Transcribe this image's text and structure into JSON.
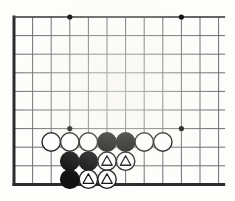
{
  "diagram": {
    "kind": "go-board-corner-diagram",
    "title": "",
    "board": {
      "orientation": "top-left-corner",
      "columns": 10,
      "rows": 10,
      "grid_spacing_px": 18.6,
      "origin_x_px": 14,
      "origin_y_px": 17,
      "line_color": "#6d6f70",
      "border_color": "#2c2c2c",
      "border_width_px": 3,
      "line_width_px": 1,
      "background_color": "#fdfdfb",
      "edges": {
        "left": "board-edge",
        "top": "board-edge",
        "bottom": "board-edge",
        "right": "cropped"
      }
    },
    "star_points": {
      "color": "#111111",
      "radius_px": 2.6,
      "points": [
        {
          "col": 3,
          "row": 0
        },
        {
          "col": 9,
          "row": 0
        },
        {
          "col": 3,
          "row": 6
        },
        {
          "col": 9,
          "row": 6
        }
      ]
    },
    "stone_style": {
      "radius_px": 9.2,
      "black_fill": "#121212",
      "black_stroke": "#121212",
      "white_fill": "#ffffff",
      "white_stroke": "#1a1a1a",
      "stroke_width_px": 1.4,
      "mark_shape": "triangle",
      "mark_stroke": "#111111",
      "mark_fill": "none"
    },
    "stones": [
      {
        "id": "w1",
        "color": "white",
        "col": 2,
        "row": 6.72,
        "mark": ""
      },
      {
        "id": "w2",
        "color": "white",
        "col": 3,
        "row": 6.72,
        "mark": ""
      },
      {
        "id": "w3",
        "color": "white",
        "col": 4,
        "row": 6.72,
        "mark": ""
      },
      {
        "id": "b1",
        "color": "black",
        "col": 5,
        "row": 6.72,
        "mark": ""
      },
      {
        "id": "b2",
        "color": "black",
        "col": 6,
        "row": 6.72,
        "mark": ""
      },
      {
        "id": "w4",
        "color": "white",
        "col": 7,
        "row": 6.72,
        "mark": ""
      },
      {
        "id": "w5",
        "color": "white",
        "col": 8,
        "row": 6.72,
        "mark": ""
      },
      {
        "id": "b3",
        "color": "black",
        "col": 3,
        "row": 7.75,
        "mark": ""
      },
      {
        "id": "b4",
        "color": "black",
        "col": 4,
        "row": 7.75,
        "mark": ""
      },
      {
        "id": "w6",
        "color": "white",
        "col": 5,
        "row": 7.75,
        "mark": "triangle"
      },
      {
        "id": "w7",
        "color": "white",
        "col": 6,
        "row": 7.75,
        "mark": "triangle"
      },
      {
        "id": "b5",
        "color": "black",
        "col": 3,
        "row": 8.72,
        "mark": ""
      },
      {
        "id": "w8",
        "color": "white",
        "col": 4,
        "row": 8.72,
        "mark": "triangle"
      },
      {
        "id": "w9",
        "color": "white",
        "col": 5,
        "row": 8.72,
        "mark": "triangle"
      }
    ]
  }
}
